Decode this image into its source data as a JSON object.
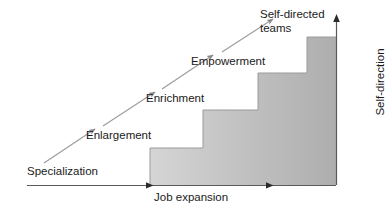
{
  "diagram": {
    "type": "staircase-progression",
    "axes": {
      "x": {
        "label": "Job expansion",
        "direction": "left-to-right",
        "arrowheads": 2,
        "baseline_y": 185
      },
      "y": {
        "label": "Self-direction",
        "direction": "bottom-to-top",
        "orientation": "vertical-rotated",
        "axis_x": 336
      }
    },
    "steps": [
      {
        "index": 1,
        "label": "Specialization",
        "x_start": 27,
        "x_end": 150,
        "top_y": 185,
        "fill": "#ffffff"
      },
      {
        "index": 2,
        "label": "Enlargement",
        "x_start": 150,
        "x_end": 203,
        "top_y": 148,
        "fill": "#dedede"
      },
      {
        "index": 3,
        "label": "Enrichment",
        "x_start": 203,
        "x_end": 258,
        "top_y": 110,
        "fill": "#cfcfcf"
      },
      {
        "index": 4,
        "label": "Empowerment",
        "x_start": 258,
        "x_end": 307,
        "top_y": 73,
        "fill": "#c2c2c2"
      },
      {
        "index": 5,
        "label": "Self-directed teams",
        "x_start": 307,
        "x_end": 336,
        "top_y": 37,
        "fill": "#b4b4b4"
      }
    ],
    "labels": {
      "specialization": "Specialization",
      "enlargement": "Enlargement",
      "enrichment": "Enrichment",
      "empowerment": "Empowerment",
      "self_directed_teams": "Self-directed teams",
      "job_expansion": "Job expansion",
      "self_direction": "Self-direction"
    },
    "arrows": [
      {
        "name": "specialization-to-enlargement",
        "from": "Specialization",
        "to": "Enlargement"
      },
      {
        "name": "enlargement-to-enrichment",
        "from": "Enlargement",
        "to": "Enrichment"
      },
      {
        "name": "enrichment-to-empowerment",
        "from": "Enrichment",
        "to": "Empowerment"
      },
      {
        "name": "empowerment-to-self-directed",
        "from": "Empowerment",
        "to": "Self-directed teams"
      }
    ],
    "colors": {
      "background": "#ffffff",
      "text": "#1a1a1a",
      "axis_line": "#4a4a4a",
      "arrow_line": "#8a8a8a",
      "step_light": "#e4e4e4",
      "step_dark": "#b0b0b0",
      "step_outline": "#9a9a9a"
    }
  }
}
